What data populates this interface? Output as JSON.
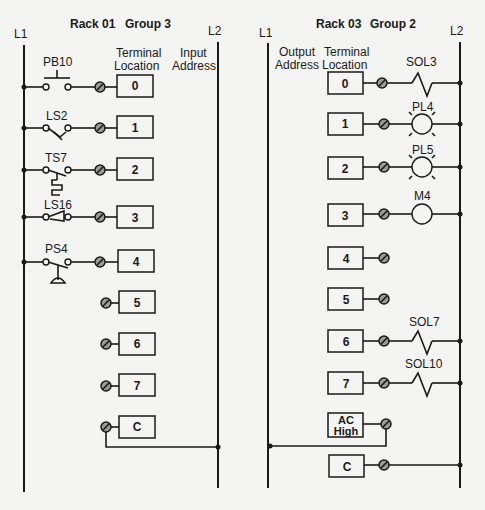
{
  "input_module": {
    "title_rack": "Rack 01",
    "title_group": "Group 3",
    "rail_left": "L1",
    "rail_right": "L2",
    "col_terminal_line1": "Terminal",
    "col_terminal_line2": "Location",
    "col_address_line1": "Input",
    "col_address_line2": "Address",
    "rows": [
      {
        "terminal": "0",
        "device": "PB10",
        "device_type": "pushbutton-no"
      },
      {
        "terminal": "1",
        "device": "LS2",
        "device_type": "limit-switch-no"
      },
      {
        "terminal": "2",
        "device": "TS7",
        "device_type": "temperature-switch-no"
      },
      {
        "terminal": "3",
        "device": "LS16",
        "device_type": "limit-switch-nc"
      },
      {
        "terminal": "4",
        "device": "PS4",
        "device_type": "pressure-switch-no"
      },
      {
        "terminal": "5",
        "device": "",
        "device_type": "unused"
      },
      {
        "terminal": "6",
        "device": "",
        "device_type": "unused"
      },
      {
        "terminal": "7",
        "device": "",
        "device_type": "unused"
      },
      {
        "terminal": "C",
        "device": "",
        "device_type": "common"
      }
    ]
  },
  "output_module": {
    "title_rack": "Rack 03",
    "title_group": "Group 2",
    "rail_left": "L1",
    "rail_right": "L2",
    "col_address_line1": "Output",
    "col_address_line2": "Address",
    "col_terminal_line1": "Terminal",
    "col_terminal_line2": "Location",
    "rows": [
      {
        "terminal": "0",
        "device": "SOL3",
        "device_type": "solenoid"
      },
      {
        "terminal": "1",
        "device": "PL4",
        "device_type": "pilot-light"
      },
      {
        "terminal": "2",
        "device": "PL5",
        "device_type": "pilot-light"
      },
      {
        "terminal": "3",
        "device": "M4",
        "device_type": "motor-starter-coil"
      },
      {
        "terminal": "4",
        "device": "",
        "device_type": "unused"
      },
      {
        "terminal": "5",
        "device": "",
        "device_type": "unused"
      },
      {
        "terminal": "6",
        "device": "SOL7",
        "device_type": "solenoid"
      },
      {
        "terminal": "7",
        "device": "SOL10",
        "device_type": "solenoid"
      },
      {
        "terminal_line1": "AC",
        "terminal_line2": "High",
        "device_type": "ac-high"
      },
      {
        "terminal": "C",
        "device": "",
        "device_type": "common"
      }
    ]
  }
}
